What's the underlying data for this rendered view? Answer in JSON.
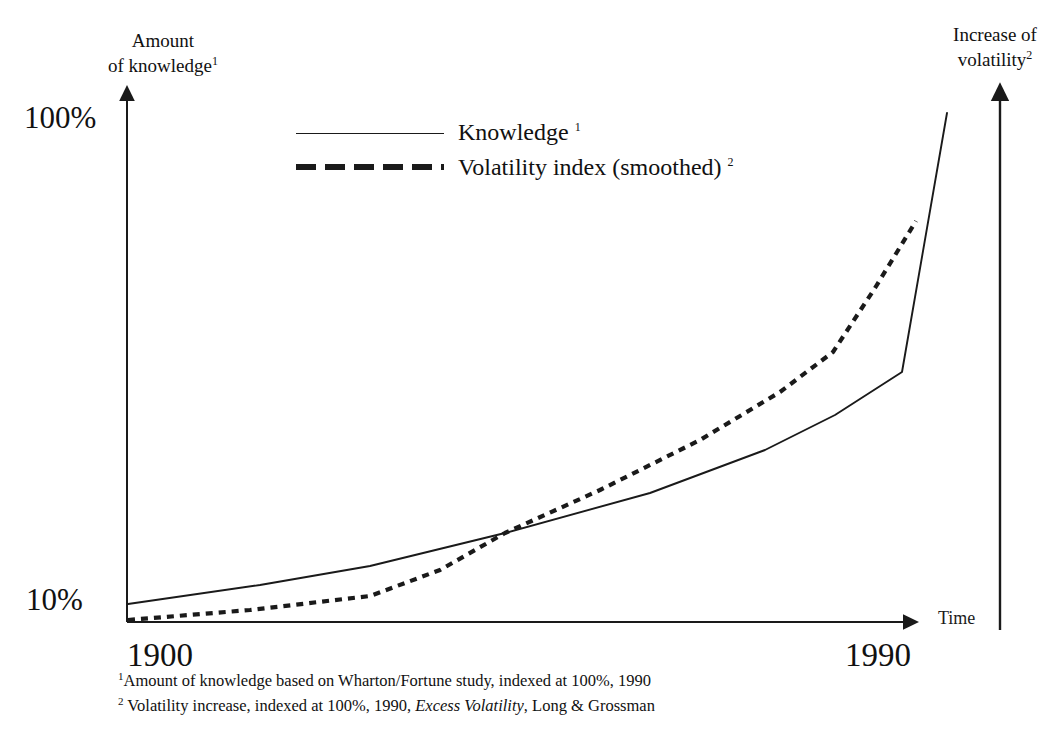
{
  "axes": {
    "left_caption_line1": "Amount",
    "left_caption_line2": "of  knowledge",
    "left_caption_sup": "1",
    "right_caption_line1": "Increase of",
    "right_caption_line2": "volatility",
    "right_caption_sup": "2",
    "x_axis_title": "Time",
    "y_tick_top": "100%",
    "y_tick_bottom": "10%",
    "x_tick_left": "1900",
    "x_tick_right": "1990"
  },
  "legend": {
    "items": [
      {
        "label": "Knowledge",
        "sup": "1",
        "style": "solid"
      },
      {
        "label": "Volatility index (smoothed)",
        "sup": "2",
        "style": "dashed"
      }
    ]
  },
  "footnotes": [
    {
      "mark": "1",
      "text_before": "Amount of knowledge based on Wharton/Fortune study, indexed at 100%, 1990",
      "italic": "",
      "text_after": ""
    },
    {
      "mark": "2",
      "text_before": " Volatility increase, indexed at 100%, 1990, ",
      "italic": "Excess Volatility",
      "text_after": ", Long & Grossman"
    }
  ],
  "colors": {
    "ink": "#1a1a1a",
    "background": "#ffffff"
  },
  "chart_data": {
    "type": "line",
    "title": "",
    "xlabel": "Time",
    "ylabel": "Amount of knowledge",
    "y2label": "Increase of volatility",
    "grid": false,
    "legend_position": "top-center",
    "xlim": [
      1900,
      1990
    ],
    "ylim": [
      10,
      100
    ],
    "y_scale": "log",
    "y_ticks": [
      10,
      100
    ],
    "y_ticklabels": [
      "10%",
      "100%"
    ],
    "x_ticks": [
      1900,
      1990
    ],
    "x_ticklabels": [
      "1900",
      "1990"
    ],
    "series": [
      {
        "name": "Knowledge",
        "style": "solid",
        "footnote": "1",
        "x": [
          1900,
          1920,
          1942,
          1973,
          1989,
          1990
        ],
        "y": [
          11.5,
          14.0,
          17.5,
          26.0,
          38.0,
          92.0
        ]
      },
      {
        "name": "Volatility index (smoothed)",
        "style": "dashed",
        "footnote": "2",
        "x": [
          1900,
          1928,
          1943,
          1962,
          1981,
          1990
        ],
        "y": [
          10.0,
          11.3,
          17.5,
          24.5,
          41.0,
          62.0
        ]
      }
    ],
    "annotations": [
      "Knowledge and volatility curves cross near 1943 and diverge sharply after 1980"
    ]
  },
  "plot_geometry": {
    "knowledge_points": "128,604 260,585 370,566 505,533 650,493 765,450 835,415 902,372 947,113",
    "volatility_points": "128,620 250,610 370,596 440,570 505,533 600,490 700,440 780,392 833,352 875,288 916,221"
  }
}
